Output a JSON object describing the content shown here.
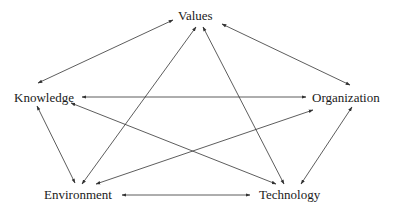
{
  "diagram": {
    "type": "network",
    "nodes": [
      {
        "id": "values",
        "label": "Values"
      },
      {
        "id": "knowledge",
        "label": "Knowledge"
      },
      {
        "id": "organization",
        "label": "Organization"
      },
      {
        "id": "environment",
        "label": "Environment"
      },
      {
        "id": "technology",
        "label": "Technology"
      }
    ],
    "edges": [
      {
        "from": "values",
        "to": "knowledge",
        "direction": "both"
      },
      {
        "from": "values",
        "to": "organization",
        "direction": "both"
      },
      {
        "from": "values",
        "to": "environment",
        "direction": "both"
      },
      {
        "from": "values",
        "to": "technology",
        "direction": "both"
      },
      {
        "from": "knowledge",
        "to": "organization",
        "direction": "both"
      },
      {
        "from": "knowledge",
        "to": "technology",
        "direction": "both"
      },
      {
        "from": "knowledge",
        "to": "environment",
        "direction": "both"
      },
      {
        "from": "organization",
        "to": "environment",
        "direction": "both"
      },
      {
        "from": "organization",
        "to": "technology",
        "direction": "both"
      },
      {
        "from": "environment",
        "to": "technology",
        "direction": "both"
      }
    ],
    "line_color": "#333333"
  }
}
